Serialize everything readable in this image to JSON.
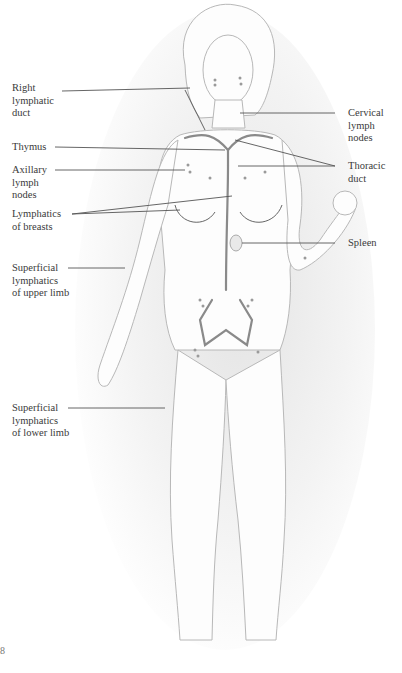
{
  "figure": {
    "labels_left": [
      {
        "id": "right-lymphatic-duct",
        "lines": [
          "Right",
          "lymphatic",
          "duct"
        ]
      },
      {
        "id": "thymus",
        "lines": [
          "Thymus"
        ]
      },
      {
        "id": "axillary-lymph-nodes",
        "lines": [
          "Axillary",
          "lymph",
          "nodes"
        ]
      },
      {
        "id": "lymphatics-of-breasts",
        "lines": [
          "Lymphatics",
          "of breasts"
        ]
      },
      {
        "id": "superficial-lymphatics-upper-limb",
        "lines": [
          "Superficial",
          "lymphatics",
          "of upper limb"
        ]
      },
      {
        "id": "superficial-lymphatics-lower-limb",
        "lines": [
          "Superficial",
          "lymphatics",
          "of lower limb"
        ]
      }
    ],
    "labels_right": [
      {
        "id": "cervical-lymph-nodes",
        "lines": [
          "Cervical",
          "lymph",
          "nodes"
        ]
      },
      {
        "id": "thoracic-duct",
        "lines": [
          "Thoracic",
          "duct"
        ]
      },
      {
        "id": "spleen",
        "lines": [
          "Spleen"
        ]
      }
    ],
    "page_fragment": "8"
  }
}
